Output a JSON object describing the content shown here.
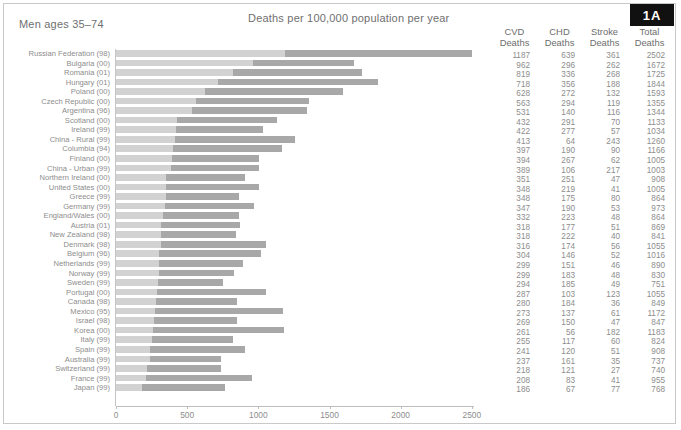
{
  "panel": {
    "badge": "1A",
    "group_label": "Men ages 35–74",
    "chart_title": "Deaths per 100,000 population per year"
  },
  "table": {
    "headers": [
      "CVD\nDeaths",
      "CHD\nDeaths",
      "Stroke\nDeaths",
      "Total\nDeaths"
    ],
    "header_cvd_l1": "CVD",
    "header_cvd_l2": "Deaths",
    "header_chd_l1": "CHD",
    "header_chd_l2": "Deaths",
    "header_stroke_l1": "Stroke",
    "header_stroke_l2": "Deaths",
    "header_total_l1": "Total",
    "header_total_l2": "Deaths"
  },
  "colors": {
    "bar_light": "#d2d2d2",
    "bar_dark": "#a8a8a8",
    "badge_bg": "#111111",
    "text": "#8d8d8d",
    "axis": "#bdbdbd"
  },
  "chart_data": {
    "type": "bar",
    "title": "Deaths per 100,000 population per year",
    "subtitle": "Men ages 35–74",
    "xlabel": "",
    "ylabel": "",
    "xlim": [
      0,
      2600
    ],
    "xticks": [
      0,
      500,
      1000,
      1500,
      2000,
      2500
    ],
    "grid": false,
    "legend": "none",
    "orientation": "horizontal",
    "stacked": true,
    "note": "Each bar is stacked: light segment = CVD Deaths, dark segment spans CVD Deaths to Total Deaths.",
    "categories": [
      "Russian Federation (98)",
      "Bulgaria (00)",
      "Romania (01)",
      "Hungary (01)",
      "Poland (00)",
      "Czech Republic (00)",
      "Argentina (96)",
      "Scotland (00)",
      "Ireland (99)",
      "China - Rural (99)",
      "Columbia (94)",
      "Finland (00)",
      "China - Urban (99)",
      "Northern Ireland (00)",
      "United States (00)",
      "Greece (99)",
      "Germany (99)",
      "England/Wales (00)",
      "Austria (01)",
      "New Zealand (98)",
      "Denmark (98)",
      "Belgium (96)",
      "Netherlands (99)",
      "Norway (99)",
      "Sweden (99)",
      "Portugal (00)",
      "Canada (98)",
      "Mexico (95)",
      "Israel (98)",
      "Korea (00)",
      "Italy (99)",
      "Spain (99)",
      "Australia (99)",
      "Switzerland (99)",
      "France (99)",
      "Japan (99)"
    ],
    "series": [
      {
        "name": "CVD Deaths",
        "values": [
          1187,
          962,
          819,
          718,
          628,
          563,
          531,
          432,
          422,
          413,
          397,
          394,
          389,
          351,
          348,
          348,
          347,
          332,
          318,
          318,
          316,
          304,
          299,
          299,
          294,
          287,
          280,
          273,
          269,
          261,
          255,
          241,
          237,
          218,
          208,
          186
        ]
      },
      {
        "name": "CHD Deaths",
        "values": [
          639,
          296,
          336,
          356,
          272,
          294,
          140,
          291,
          277,
          64,
          190,
          267,
          106,
          251,
          219,
          175,
          190,
          223,
          177,
          222,
          174,
          146,
          151,
          183,
          185,
          103,
          184,
          137,
          150,
          56,
          117,
          120,
          161,
          121,
          83,
          67
        ]
      },
      {
        "name": "Stroke Deaths",
        "values": [
          361,
          262,
          268,
          188,
          132,
          119,
          116,
          70,
          57,
          243,
          90,
          62,
          217,
          47,
          41,
          80,
          53,
          48,
          51,
          40,
          56,
          52,
          46,
          48,
          49,
          123,
          36,
          61,
          47,
          182,
          60,
          51,
          35,
          27,
          41,
          77
        ]
      },
      {
        "name": "Total Deaths",
        "values": [
          2502,
          1672,
          1725,
          1844,
          1593,
          1355,
          1344,
          1133,
          1034,
          1260,
          1166,
          1005,
          1003,
          908,
          1005,
          864,
          973,
          864,
          869,
          841,
          1055,
          1016,
          890,
          830,
          751,
          1055,
          849,
          1172,
          847,
          1183,
          824,
          908,
          737,
          740,
          955,
          768
        ]
      }
    ]
  }
}
